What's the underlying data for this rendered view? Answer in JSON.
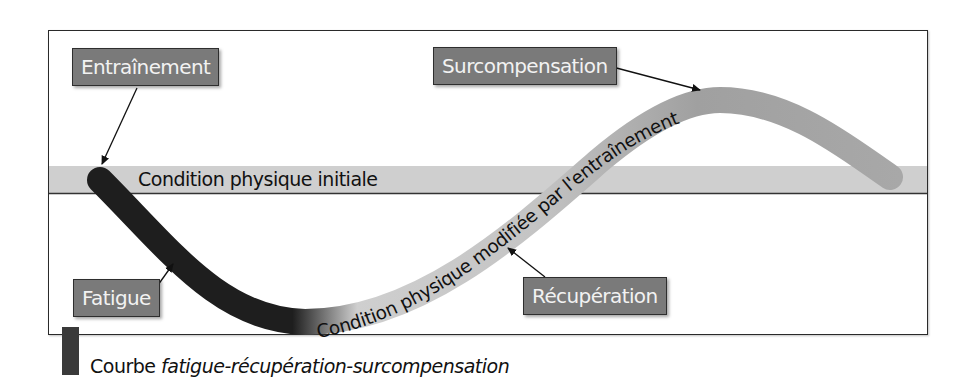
{
  "diagram": {
    "labels": {
      "training": "Entraînement",
      "supercompensation": "Surcompensation",
      "fatigue": "Fatigue",
      "recovery": "Récupération"
    },
    "baseline_label": "Condition physique initiale",
    "curve_label": "Condition physique modifiée par l'entraînement",
    "caption": {
      "prefix": "Courbe ",
      "emphasis": "fatigue-récupération-surcompensation"
    },
    "colors": {
      "label_box": "#7a7a7a",
      "baseline_band": "#cfcfcf",
      "curve_dark": "#1e1e1e",
      "curve_light": "#d0d0d0",
      "curve_mid": "#a3a3a3",
      "frame": "#2a2a2a"
    }
  }
}
